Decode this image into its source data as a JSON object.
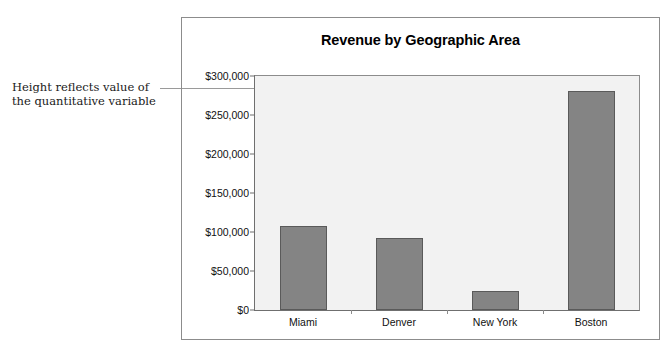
{
  "annotation": {
    "line1": "Height reflects value of",
    "line2": "the quantitative variable"
  },
  "chart_data": {
    "type": "bar",
    "title": "Revenue by Geographic Area",
    "xlabel": "",
    "ylabel": "",
    "categories": [
      "Miami",
      "Denver",
      "New York",
      "Boston"
    ],
    "values": [
      108000,
      92000,
      24000,
      281000
    ],
    "ylim": [
      0,
      300000
    ],
    "yticks": [
      0,
      50000,
      100000,
      150000,
      200000,
      250000,
      300000
    ],
    "ytick_labels": [
      "$0",
      "$50,000",
      "$100,000",
      "$150,000",
      "$200,000",
      "$250,000",
      "$300,000"
    ],
    "grid": false,
    "legend": null,
    "bar_color": "#848484",
    "bar_border_color": "#5a5a5a",
    "plot_background": "#f2f2f2",
    "annotations": [
      {
        "text": "Height reflects value of the quantitative variable",
        "points_to_value": 281000,
        "points_to_category": "Boston"
      }
    ]
  }
}
